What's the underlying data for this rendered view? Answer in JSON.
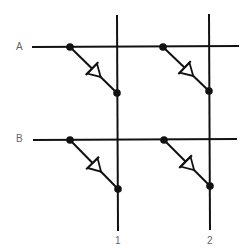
{
  "diagram": {
    "title": "",
    "type": "diode matrix",
    "colors": {
      "line": "#111111",
      "label": "#666666",
      "background": "#ffffff"
    },
    "rows": [
      {
        "label": "A",
        "y": 47
      },
      {
        "label": "B",
        "y": 139
      }
    ],
    "columns": [
      {
        "label": "1",
        "x": 117
      },
      {
        "label": "2",
        "x": 209
      }
    ],
    "cells": [
      {
        "row": "A",
        "column": "1",
        "component": "diode",
        "from": [
          70,
          47
        ],
        "to": [
          117,
          93
        ]
      },
      {
        "row": "A",
        "column": "2",
        "component": "diode",
        "from": [
          163,
          47
        ],
        "to": [
          209,
          91
        ]
      },
      {
        "row": "B",
        "column": "1",
        "component": "diode",
        "from": [
          70,
          140
        ],
        "to": [
          118,
          189
        ]
      },
      {
        "row": "B",
        "column": "2",
        "component": "diode",
        "from": [
          164,
          140
        ],
        "to": [
          210,
          186
        ]
      }
    ]
  }
}
